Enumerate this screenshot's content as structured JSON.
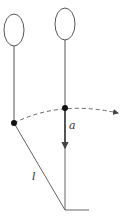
{
  "diagram": {
    "type": "pendulum-balloon-physics",
    "colors": {
      "line": "#555555",
      "dot": "#111111",
      "background": "#ffffff"
    },
    "labels": {
      "acceleration": "a",
      "length": "l"
    },
    "elements": [
      "left-balloon",
      "right-balloon",
      "dashed-swing-arc-with-arrow",
      "acceleration-arrow",
      "string-length-line",
      "pivot-base"
    ]
  }
}
